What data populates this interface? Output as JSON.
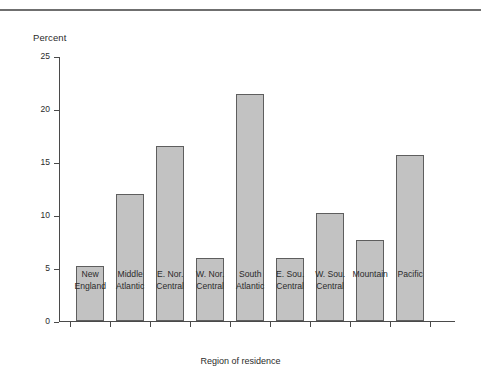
{
  "chart_data": {
    "type": "bar",
    "title": "",
    "subtitle": "",
    "xlabel": "Region of residence",
    "ylabel": "Percent",
    "ylim": [
      0,
      25
    ],
    "yticks": [
      0,
      5,
      10,
      15,
      20,
      25
    ],
    "ytick_labels": [
      "0",
      "5",
      "10",
      "15",
      "20",
      "25"
    ],
    "grid": false,
    "legend": null,
    "categories": [
      "New\nEngland",
      "Middle\nAtlantic",
      "E. Nor.\nCentral",
      "W. Nor.\nCentral",
      "South\nAtlantic",
      "E. Sou.\nCentral",
      "W. Sou.\nCentral",
      "Mountain",
      "Pacific"
    ],
    "values": [
      5.2,
      12.0,
      16.5,
      5.9,
      21.4,
      5.9,
      10.2,
      7.6,
      15.7
    ],
    "bar_color": "#c2c2c2",
    "bar_edge_color": "#5e5e5e",
    "axis_color": "#4a4a4a"
  },
  "figure": {
    "top_rule_color": "#6f6f6f"
  }
}
